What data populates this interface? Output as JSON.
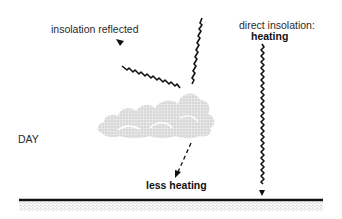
{
  "diagram": {
    "type": "insolation-cloud-day",
    "labels": {
      "reflected": "insolation reflected",
      "direct_line1": "direct insolation:",
      "direct_line2": "heating",
      "time_of_day": "DAY",
      "less_heating": "less heating"
    },
    "elements": [
      {
        "id": "incoming-ray-to-cloud",
        "kind": "wavy-arrow",
        "from": [
          202,
          18
        ],
        "to": [
          180,
          88
        ]
      },
      {
        "id": "reflected-ray",
        "kind": "wavy-arrow",
        "from": [
          180,
          88
        ],
        "to": [
          118,
          40
        ],
        "label": "insolation reflected"
      },
      {
        "id": "cloud",
        "kind": "stippled-cloud",
        "bbox": [
          97,
          88,
          215,
          138
        ]
      },
      {
        "id": "transmitted-ray",
        "kind": "dashed-arrow",
        "from": [
          191,
          143
        ],
        "to": [
          176,
          176
        ],
        "label": "less heating"
      },
      {
        "id": "direct-ray",
        "kind": "wavy-arrow",
        "from": [
          262,
          44
        ],
        "to": [
          262,
          194
        ],
        "label": "direct insolation: heating"
      },
      {
        "id": "ground",
        "kind": "surface-line-with-stipple",
        "from": [
          19,
          200
        ],
        "to": [
          323,
          200
        ]
      }
    ],
    "colors": {
      "ink": "#111111",
      "text": "#2a2a2a",
      "cloud": "#d4d4d4",
      "ground_stipple": "#9a9a9a"
    }
  }
}
